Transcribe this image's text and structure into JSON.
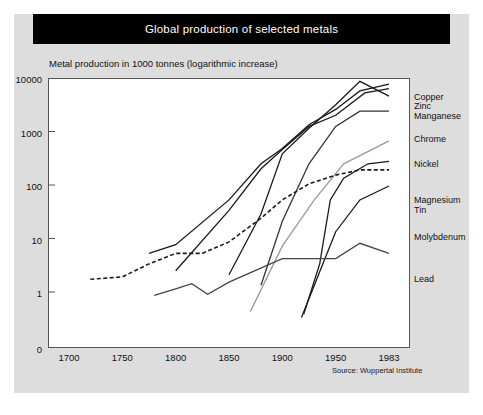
{
  "title": "Global production of selected metals",
  "subtitle": "Metal production in 1000 tonnes (logarithmic increase)",
  "source": "Source: Wuppertal Institute",
  "colors": {
    "title_bar": "#000000",
    "title_text": "#ffffff",
    "panel": "#dddddd",
    "plot_background": "#ffffff",
    "axis": "#555555",
    "line_dark": "#1a1a1a",
    "line_mid": "#555555",
    "line_light": "#9a9a9a"
  },
  "chart_data": {
    "type": "line",
    "title": "Global production of selected metals",
    "subtitle": "Metal production in 1000 tonnes (logarithmic increase)",
    "xlabel": "",
    "ylabel": "Metal production in 1000 tonnes (logarithmic increase)",
    "yscale": "log",
    "ylim": [
      0.3,
      10000
    ],
    "xlim": [
      1690,
      1995
    ],
    "grid": false,
    "legend_position": "right",
    "y_ticks": [
      {
        "label": "10000",
        "value": 10000
      },
      {
        "label": "1000",
        "value": 1000
      },
      {
        "label": "100",
        "value": 100
      },
      {
        "label": "10",
        "value": 10
      },
      {
        "label": "1",
        "value": 1
      },
      {
        "label": "0",
        "value": 0.3
      }
    ],
    "x_ticks": [
      {
        "label": "1700",
        "value": 1700
      },
      {
        "label": "1750",
        "value": 1750
      },
      {
        "label": "1800",
        "value": 1800
      },
      {
        "label": "1850",
        "value": 1850
      },
      {
        "label": "1900",
        "value": 1900
      },
      {
        "label": "1950",
        "value": 1950
      },
      {
        "label": "1983",
        "value": 1983
      }
    ],
    "series": [
      {
        "name": "Copper",
        "style": "solid",
        "color": "#1a1a1a",
        "label_top": 78,
        "x": [
          1775,
          1800,
          1850,
          1880,
          1900,
          1925,
          1950,
          1965,
          1983
        ],
        "y": [
          5.5,
          8.0,
          55,
          260,
          500,
          1400,
          2700,
          6000,
          8000
        ]
      },
      {
        "name": "Zinc",
        "style": "solid",
        "color": "#1a1a1a",
        "label_top": 87,
        "x": [
          1800,
          1850,
          1880,
          1900,
          1925,
          1950,
          1968,
          1983
        ],
        "y": [
          2.6,
          35,
          210,
          480,
          1300,
          2100,
          5500,
          6600
        ]
      },
      {
        "name": "Manganese",
        "style": "solid",
        "color": "#1a1a1a",
        "label_top": 97,
        "x": [
          1850,
          1880,
          1900,
          1925,
          1950,
          1965,
          1983
        ],
        "y": [
          2.2,
          30,
          400,
          1200,
          3300,
          9000,
          4800
        ]
      },
      {
        "name": "Chrome",
        "style": "solid",
        "color": "#333333",
        "label_top": 120,
        "x": [
          1880,
          1900,
          1925,
          1950,
          1965,
          1983
        ],
        "y": [
          1.4,
          22,
          260,
          1300,
          2500,
          2500
        ]
      },
      {
        "name": "Nickel",
        "style": "solid",
        "color": "#9a9a9a",
        "label_top": 145,
        "x": [
          1870,
          1900,
          1930,
          1955,
          1983
        ],
        "y": [
          0.45,
          7.5,
          55,
          260,
          700
        ]
      },
      {
        "name": "Magnesium",
        "style": "solid",
        "color": "#1a1a1a",
        "label_top": 181,
        "x": [
          1920,
          1935,
          1945,
          1955,
          1970,
          1983
        ],
        "y": [
          0.4,
          3.5,
          55,
          140,
          260,
          290
        ]
      },
      {
        "name": "Tin",
        "style": "dashed",
        "color": "#1a1a1a",
        "label_top": 191,
        "x": [
          1720,
          1750,
          1775,
          1800,
          1825,
          1850,
          1880,
          1900,
          1925,
          1950,
          1965,
          1983
        ],
        "y": [
          1.8,
          2.0,
          3.5,
          5.5,
          5.5,
          9,
          25,
          55,
          110,
          160,
          200,
          200
        ]
      },
      {
        "name": "Molybdenum",
        "style": "solid",
        "color": "#1a1a1a",
        "label_top": 218,
        "x": [
          1918,
          1935,
          1950,
          1965,
          1983
        ],
        "y": [
          0.35,
          2.5,
          14,
          55,
          100
        ]
      },
      {
        "name": "Lead",
        "style": "solid",
        "color": "#444444",
        "label_top": 260,
        "x": [
          1780,
          1800,
          1815,
          1830,
          1850,
          1900,
          1950,
          1965,
          1983
        ],
        "y": [
          0.9,
          1.2,
          1.5,
          0.95,
          1.6,
          4.4,
          4.4,
          8.5,
          5.5
        ]
      }
    ]
  }
}
